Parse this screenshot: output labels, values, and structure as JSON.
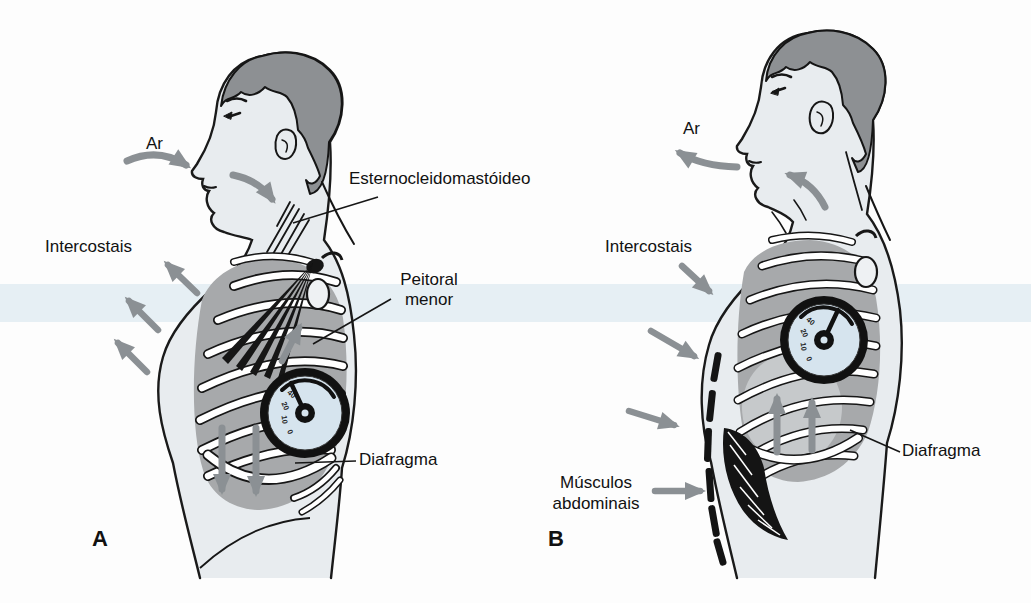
{
  "figure_a": {
    "letter": "A",
    "air": "Ar",
    "sternocleidomastoid": "Esternocleidomastóideo",
    "intercostals": "Intercostais",
    "pectoralis": [
      "Peitoral",
      "menor"
    ],
    "diaphragm": "Diafragma",
    "gauge_ticks": [
      "40",
      "20",
      "10",
      "0"
    ]
  },
  "figure_b": {
    "letter": "B",
    "air": "Ar",
    "intercostals": "Intercostais",
    "abdominals": [
      "Músculos",
      "abdominais"
    ],
    "diaphragm": "Diafragma",
    "gauge_ticks": [
      "40",
      "20",
      "10",
      "0"
    ]
  },
  "colors": {
    "arrow_gray": "#8b9094",
    "hair_gray": "#8d9093",
    "skin": "#e8ecef",
    "ribcage_gray": "#a7a9ab",
    "lung_light": "#c6c9cb",
    "gauge_face_blue": "#d6e4ee",
    "background_band_blue": "#cfe0ec",
    "ink": "#111111"
  }
}
